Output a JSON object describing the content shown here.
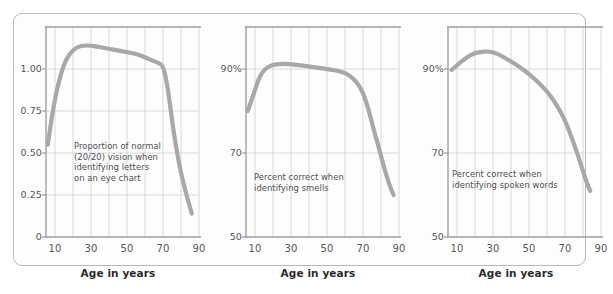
{
  "figure": {
    "background": "#ffffff",
    "frame_color": "#b9b9b9",
    "curve_color": "#a8a8a8",
    "grid_color": "#cfcfd4",
    "axis_color": "#9a9a9f",
    "text_color": "#56565a"
  },
  "chart_data": [
    {
      "type": "line",
      "panel": 1,
      "title": "",
      "xlabel": "Age in years",
      "ylabel": "",
      "annotation": "Proportion of normal\n(20/20) vision when\nidentifying letters\non an eye chart",
      "grid": true,
      "legend": "none",
      "xlim": [
        5,
        90
      ],
      "ylim": [
        0,
        1.25
      ],
      "xticks": [
        10,
        30,
        50,
        70,
        90
      ],
      "xticklabels": [
        "10",
        "30",
        "50",
        "70",
        "90"
      ],
      "xminorticks": [
        10,
        20,
        30,
        40,
        50,
        60,
        70,
        80,
        90
      ],
      "yticks": [
        0,
        0.25,
        0.5,
        0.75,
        1.0
      ],
      "yticklabels": [
        "0",
        "0.25",
        "0.50",
        "0.75",
        "1.00"
      ],
      "x": [
        6,
        8,
        10,
        12,
        15,
        18,
        22,
        26,
        30,
        35,
        40,
        45,
        50,
        55,
        60,
        64,
        67,
        70,
        72,
        74,
        76,
        78,
        80,
        83,
        86
      ],
      "y": [
        0.55,
        0.7,
        0.82,
        0.92,
        1.03,
        1.09,
        1.13,
        1.14,
        1.14,
        1.13,
        1.12,
        1.11,
        1.1,
        1.09,
        1.07,
        1.05,
        1.04,
        1.02,
        0.93,
        0.78,
        0.62,
        0.49,
        0.38,
        0.25,
        0.14
      ]
    },
    {
      "type": "line",
      "panel": 2,
      "title": "",
      "xlabel": "Age in years",
      "ylabel": "",
      "annotation": "Percent correct when\nidentifying smells",
      "grid": true,
      "legend": "none",
      "xlim": [
        5,
        90
      ],
      "ylim": [
        50,
        100
      ],
      "xticks": [
        10,
        30,
        50,
        70,
        90
      ],
      "xticklabels": [
        "10",
        "30",
        "50",
        "70",
        "90"
      ],
      "xminorticks": [
        10,
        20,
        30,
        40,
        50,
        60,
        70,
        80,
        90
      ],
      "yticks": [
        50,
        70,
        90
      ],
      "yticklabels": [
        "50",
        "70",
        "90%"
      ],
      "x": [
        6,
        8,
        10,
        12,
        14,
        17,
        20,
        24,
        28,
        33,
        38,
        45,
        52,
        58,
        62,
        66,
        70,
        73,
        76,
        79,
        82,
        85,
        87
      ],
      "y": [
        80.0,
        82.5,
        85.0,
        87.6,
        89.2,
        90.5,
        91.0,
        91.2,
        91.2,
        91.0,
        90.7,
        90.3,
        89.9,
        89.4,
        88.6,
        87.2,
        84.5,
        80.5,
        75.5,
        71.0,
        66.0,
        62.0,
        60.0
      ]
    },
    {
      "type": "line",
      "panel": 3,
      "title": "",
      "xlabel": "Age in years",
      "ylabel": "",
      "annotation": "Percent correct when\nidentifying spoken words",
      "grid": true,
      "legend": "none",
      "xlim": [
        5,
        90
      ],
      "ylim": [
        50,
        100
      ],
      "xticks": [
        10,
        30,
        50,
        70,
        90
      ],
      "xticklabels": [
        "10",
        "30",
        "50",
        "70",
        "90"
      ],
      "xminorticks": [
        10,
        20,
        30,
        40,
        50,
        60,
        70,
        80,
        90
      ],
      "yticks": [
        50,
        70,
        90
      ],
      "yticklabels": [
        "50",
        "70",
        "90%"
      ],
      "x": [
        7,
        9,
        11,
        14,
        17,
        20,
        24,
        27,
        30,
        34,
        38,
        43,
        48,
        53,
        58,
        62,
        66,
        70,
        73,
        76,
        79,
        82,
        84
      ],
      "y": [
        89.8,
        90.5,
        91.3,
        92.3,
        93.2,
        93.8,
        94.1,
        94.2,
        94.0,
        93.3,
        92.3,
        91.0,
        89.5,
        87.7,
        85.6,
        83.6,
        81.0,
        77.8,
        74.5,
        71.0,
        67.0,
        63.0,
        61.0
      ]
    }
  ]
}
